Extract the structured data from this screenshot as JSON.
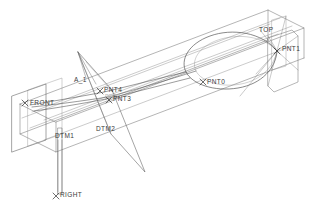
{
  "drawing": {
    "title": "3D wireframe sweep model",
    "background_color": "#ffffff",
    "line_color": "#555555",
    "accent_line_color": "#777777",
    "text_color": "#3a3a3a",
    "faint_text_color": "#b9b9b9"
  },
  "datum_planes": [
    {
      "id": "front",
      "label": "FRONT",
      "x": 27,
      "y": 103
    },
    {
      "id": "top",
      "label": "TOP",
      "x": 259,
      "y": 31
    },
    {
      "id": "right",
      "label": "RIGHT",
      "x": 58,
      "y": 196
    },
    {
      "id": "dtm1",
      "label": "DTM1",
      "x": 55,
      "y": 137
    },
    {
      "id": "dtm2",
      "label": "DTM2",
      "x": 96,
      "y": 130
    }
  ],
  "axes": [
    {
      "id": "a_1",
      "label": "A_1",
      "x": 74,
      "y": 80
    }
  ],
  "points": [
    {
      "id": "pnt0",
      "label": "PNT0",
      "x": 206,
      "y": 82
    },
    {
      "id": "pnt1",
      "label": "PNT1",
      "x": 281,
      "y": 48
    },
    {
      "id": "pnt2",
      "label": "PNT2",
      "x": 104,
      "y": 95,
      "faint": true
    },
    {
      "id": "pnt3",
      "label": "PNT3",
      "x": 113,
      "y": 100
    },
    {
      "id": "pnt4",
      "label": "PNT4",
      "x": 104,
      "y": 91
    }
  ],
  "markers": {
    "cross_glyph": "x-marker-icon",
    "point_count": 5
  },
  "geometry": {
    "shape": "teardrop-sweep-loop",
    "enclosure": "isometric-box-wireframe"
  }
}
